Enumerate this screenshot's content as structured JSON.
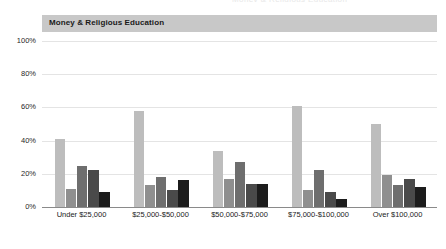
{
  "header": {
    "title": "Money & Religious Education",
    "band_color": "#c8c8c8",
    "clipped_text": "Money & Religious Education"
  },
  "chart_data": {
    "type": "bar",
    "title": "Money & Religious Education",
    "xlabel": "",
    "ylabel": "",
    "ylim": [
      0,
      100
    ],
    "ytick_labels": [
      "0%",
      "20%",
      "40%",
      "60%",
      "80%",
      "100%"
    ],
    "ytick_values": [
      0,
      20,
      40,
      60,
      80,
      100
    ],
    "grid": true,
    "legend": "none",
    "categories": [
      "Under $25,000",
      "$25,000-$50,000",
      "$50,000-$75,000",
      "$75,000-$100,000",
      "Over $100,000"
    ],
    "series": [
      {
        "name": "Series 1",
        "color": "#bdbdbd",
        "values": [
          41,
          58,
          34,
          61,
          50
        ]
      },
      {
        "name": "Series 2",
        "color": "#8f8f8f",
        "values": [
          11,
          13,
          17,
          10,
          19
        ]
      },
      {
        "name": "Series 3",
        "color": "#6e6e6e",
        "values": [
          25,
          18,
          27,
          22,
          13
        ]
      },
      {
        "name": "Series 4",
        "color": "#4a4a4a",
        "values": [
          22,
          10,
          14,
          9,
          17
        ]
      },
      {
        "name": "Series 5",
        "color": "#1c1c1c",
        "values": [
          9,
          16,
          14,
          5,
          12
        ]
      }
    ]
  }
}
